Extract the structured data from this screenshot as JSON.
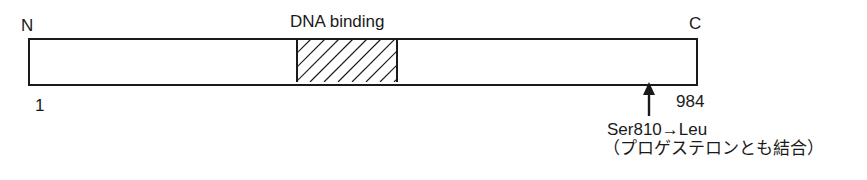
{
  "diagram": {
    "type": "protein-domain-map",
    "termini": {
      "n_label": "N",
      "c_label": "C"
    },
    "positions": {
      "start": "1",
      "end": "984"
    },
    "domains": [
      {
        "label": "DNA binding",
        "pattern": "diagonal-hatch"
      }
    ],
    "mutation": {
      "label": "Ser810→Leu",
      "note": "（プロゲステロンとも結合）"
    }
  },
  "colors": {
    "line": "#1a1a1a",
    "background": "#ffffff"
  }
}
